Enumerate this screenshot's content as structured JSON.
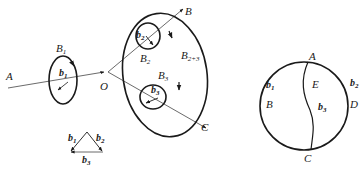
{
  "diagram": {
    "colors": {
      "stroke": "#1a1a1a",
      "thin": "#444444",
      "background": "#ffffff"
    },
    "left_figure": {
      "lines": [
        {
          "from": "A",
          "to": "O",
          "label_from": "A",
          "label_to": "O"
        },
        {
          "from": "O",
          "to": "B",
          "label": "B"
        },
        {
          "from": "O",
          "to": "C",
          "label": "C"
        }
      ],
      "loops": [
        {
          "id": "B1",
          "label": "B",
          "sub": "1",
          "inner_label": "b",
          "inner_sub": "1"
        },
        {
          "id": "B2",
          "label": "B",
          "sub": "2",
          "inner_label": "b",
          "inner_sub": "2"
        },
        {
          "id": "B3",
          "label": "B",
          "sub": "3",
          "inner_label": "b",
          "inner_sub": "3"
        },
        {
          "id": "B2+3",
          "label": "B",
          "sub": "2+3"
        }
      ],
      "labels": {
        "A": "A",
        "O": "O",
        "B": "B",
        "C": "C",
        "B1": "B",
        "B1_sub": "1",
        "b1": "b",
        "b1_sub": "1",
        "B2": "B",
        "B2_sub": "2",
        "b2": "b",
        "b2_sub": "2",
        "B3": "B",
        "B3_sub": "3",
        "b3": "b",
        "b3_sub": "3",
        "B23": "B",
        "B23_sub": "2+3"
      }
    },
    "triangle": {
      "edges": [
        {
          "label": "b",
          "sub": "1"
        },
        {
          "label": "b",
          "sub": "2"
        },
        {
          "label": "b",
          "sub": "3"
        }
      ],
      "labels": {
        "b1": "b",
        "b1_sub": "1",
        "b2": "b",
        "b2_sub": "2",
        "b3": "b",
        "b3_sub": "3"
      }
    },
    "circle_figure": {
      "points": [
        "A",
        "B",
        "C",
        "D",
        "E"
      ],
      "labels": {
        "A": "A",
        "B": "B",
        "C": "C",
        "D": "D",
        "E": "E",
        "b1": "b",
        "b1_sub": "1",
        "b2": "b",
        "b2_sub": "2",
        "b3": "b",
        "b3_sub": "3"
      }
    }
  }
}
